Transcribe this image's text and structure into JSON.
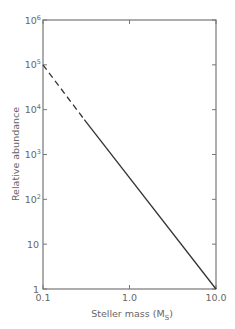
{
  "chart_data": {
    "type": "line",
    "title": "",
    "xlabel": "Steller mass (M_S)",
    "xlabel_main": "Steller mass (M",
    "xlabel_sub": "S",
    "xlabel_close": ")",
    "ylabel": "Relative abundance",
    "xscale": "log",
    "yscale": "log",
    "xlim": [
      0.1,
      10.0
    ],
    "ylim": [
      1,
      1000000
    ],
    "x_ticks": [
      {
        "value": 0.1,
        "label": "0.1"
      },
      {
        "value": 1.0,
        "label": "1.0"
      },
      {
        "value": 10.0,
        "label": "10.0"
      }
    ],
    "y_ticks": [
      {
        "value": 1,
        "base": "1",
        "exp": ""
      },
      {
        "value": 10,
        "base": "10",
        "exp": ""
      },
      {
        "value": 100,
        "base": "10",
        "exp": "2"
      },
      {
        "value": 1000,
        "base": "10",
        "exp": "3"
      },
      {
        "value": 10000,
        "base": "10",
        "exp": "4"
      },
      {
        "value": 100000,
        "base": "10",
        "exp": "5"
      },
      {
        "value": 1000000,
        "base": "10",
        "exp": "6"
      }
    ],
    "grid": false,
    "legend": null,
    "series": [
      {
        "name": "extrapolated (dashed)",
        "style": "dashed",
        "x": [
          0.1,
          0.3
        ],
        "y": [
          100000,
          6000
        ]
      },
      {
        "name": "observed (solid)",
        "style": "solid",
        "x": [
          0.3,
          10.0
        ],
        "y": [
          6000,
          1
        ]
      }
    ],
    "colors": {
      "line": "#333333",
      "axis": "#777777",
      "text": "#666666"
    }
  }
}
